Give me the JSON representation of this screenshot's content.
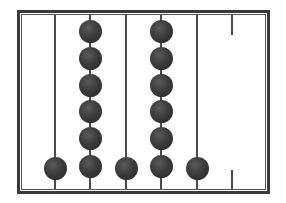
{
  "figure": {
    "type": "abacus",
    "frame_color": "#3a3a3a",
    "bead_color": "#3c3c3c",
    "columns": [
      {
        "index": 1,
        "x": 55,
        "rod": "full",
        "bead_count": 1,
        "bead_y": [
          168
        ]
      },
      {
        "index": 2,
        "x": 90,
        "rod": "full",
        "bead_count": 6,
        "bead_y": [
          31,
          58,
          85,
          111,
          138,
          166
        ]
      },
      {
        "index": 3,
        "x": 126,
        "rod": "full",
        "bead_count": 1,
        "bead_y": [
          168
        ]
      },
      {
        "index": 4,
        "x": 161,
        "rod": "full",
        "bead_count": 6,
        "bead_y": [
          31,
          58,
          85,
          111,
          138,
          166
        ]
      },
      {
        "index": 5,
        "x": 197,
        "rod": "full",
        "bead_count": 1,
        "bead_y": [
          168
        ]
      },
      {
        "index": 6,
        "x": 232,
        "rod": "stubs",
        "bead_count": 0,
        "bead_y": []
      }
    ],
    "represented_digits": [
      1,
      6,
      1,
      6,
      1,
      0
    ]
  }
}
